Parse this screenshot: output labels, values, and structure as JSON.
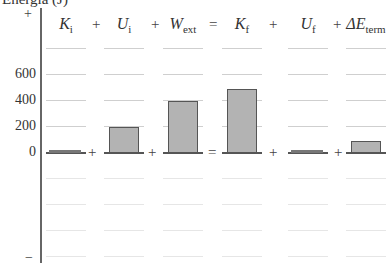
{
  "title": "Energía (J)",
  "axis": {
    "top_sign": "+",
    "bottom_sign": "−"
  },
  "chart_data": {
    "type": "bar",
    "title": "Energía (J)",
    "ylabel": "Energía (J)",
    "yticks": [
      0,
      200,
      400,
      600
    ],
    "ylim": [
      -800,
      800
    ],
    "categories": [
      "K_i",
      "U_i",
      "W_ext",
      "K_f",
      "U_f",
      "ΔE_term"
    ],
    "values": [
      10,
      200,
      400,
      490,
      0,
      90
    ],
    "equation": "K_i + U_i + W_ext = K_f + U_f + ΔE_term",
    "grid": true
  },
  "yticks": [
    {
      "label": "600",
      "value": 600
    },
    {
      "label": "400",
      "value": 400
    },
    {
      "label": "200",
      "value": 200
    },
    {
      "label": "0",
      "value": 0
    }
  ],
  "columns": [
    {
      "sym": "K",
      "sub": "i",
      "value": 10,
      "op_after": "+"
    },
    {
      "sym": "U",
      "sub": "i",
      "value": 200,
      "op_after": "+"
    },
    {
      "sym": "W",
      "sub": "ext",
      "value": 400,
      "op_after": "="
    },
    {
      "sym": "K",
      "sub": "f",
      "value": 490,
      "op_after": "+"
    },
    {
      "sym": "U",
      "sub": "f",
      "value": 0,
      "op_after": "+"
    },
    {
      "sym": "ΔE",
      "sub": "term",
      "value": 90,
      "op_after": ""
    }
  ],
  "header_ops": [
    "+",
    "+",
    "=",
    "+",
    "+"
  ]
}
